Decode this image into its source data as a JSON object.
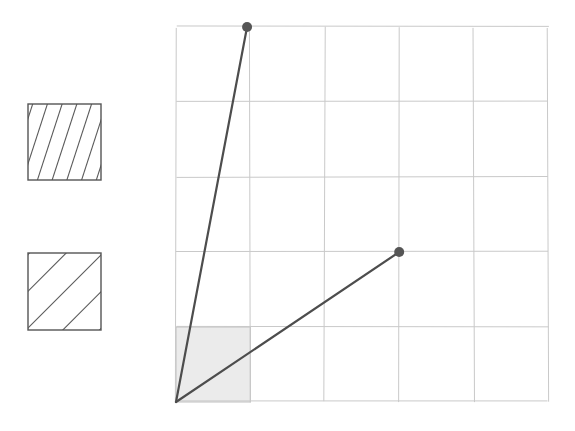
{
  "figure": {
    "title": "",
    "background_color": "#ffffff",
    "width": 575,
    "height": 431
  },
  "chart_data": {
    "type": "line",
    "title": "",
    "xlabel": "",
    "ylabel": "",
    "grid": true,
    "legend_position": "left",
    "xlim": [
      0,
      5
    ],
    "ylim": [
      0,
      5
    ],
    "x_ticks": [
      0,
      1,
      2,
      3,
      4,
      5
    ],
    "y_ticks": [
      0,
      1,
      2,
      3,
      4,
      5
    ],
    "x_tick_labels": [
      "",
      "",
      "",
      "",
      "",
      ""
    ],
    "y_tick_labels": [
      "",
      "",
      "",
      "",
      "",
      ""
    ],
    "series": [
      {
        "name": "steep-ray",
        "label": "",
        "color": "#4d4d4d",
        "linewidth": 2.2,
        "marker": "circle",
        "marker_end_only": true,
        "points": [
          {
            "x": 0,
            "y": 0
          },
          {
            "x": 0.955,
            "y": 5.0
          }
        ]
      },
      {
        "name": "diagonal-ray",
        "label": "",
        "color": "#4d4d4d",
        "linewidth": 2.2,
        "marker": "circle",
        "marker_end_only": true,
        "points": [
          {
            "x": 0,
            "y": 0
          },
          {
            "x": 3.0,
            "y": 2.0
          }
        ]
      }
    ],
    "shaded_regions": [
      {
        "name": "unit-cell-shading",
        "x0": 0,
        "y0": 0,
        "x1": 1,
        "y1": 1,
        "fill": "#ebebeb",
        "edge": "#c0c0c0"
      }
    ],
    "markers": [
      {
        "name": "endpoint-steep",
        "x": 0.955,
        "y": 5.0,
        "color": "#555555",
        "radius": 5
      },
      {
        "name": "endpoint-diagonal",
        "x": 3.0,
        "y": 2.0,
        "color": "#555555",
        "radius": 5
      }
    ],
    "grid_color": "#c9c9c9",
    "grid_line_width": 1
  },
  "legend": {
    "position": "left",
    "swatches": [
      {
        "name": "steep-hatch-swatch",
        "label": "",
        "pattern": "steep-diagonal-hatch",
        "hatch_angle_deg": 72,
        "hatch_spacing": 14,
        "line_count": 5,
        "fill": "#ffffff",
        "edge": "#555555",
        "line_color": "#5a5a5a",
        "x": 28,
        "y": 104,
        "width": 73,
        "height": 76
      },
      {
        "name": "diagonal-hatch-swatch",
        "label": "",
        "pattern": "45-degree-diagonal-hatch",
        "hatch_angle_deg": 45,
        "hatch_spacing": 26,
        "line_count": 4,
        "fill": "#ffffff",
        "edge": "#555555",
        "line_color": "#5a5a5a",
        "x": 28,
        "y": 253,
        "width": 73,
        "height": 77
      }
    ]
  },
  "plot_area": {
    "name": "grid-plot-area",
    "left": 176,
    "top": 27,
    "right": 548,
    "bottom": 402,
    "columns": 5,
    "rows": 5,
    "cell_width": 74.4,
    "cell_height": 75.0
  },
  "colors": {
    "grid": "#c9c9c9",
    "ray": "#4d4d4d",
    "marker": "#555555",
    "shade_fill": "#ebebeb",
    "swatch_edge": "#555555",
    "hatch": "#5a5a5a",
    "background": "#ffffff"
  }
}
